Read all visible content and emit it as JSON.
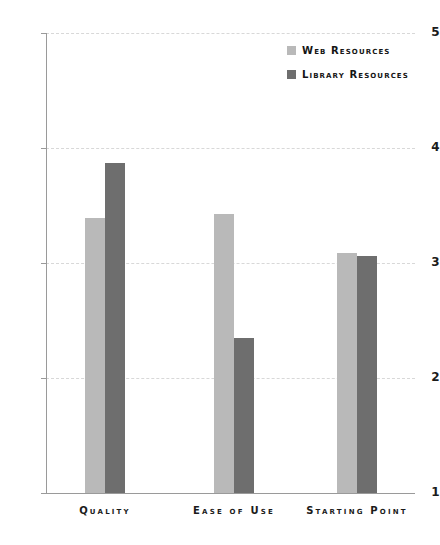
{
  "chart_data": {
    "type": "bar",
    "title": "",
    "xlabel": "",
    "ylabel": "",
    "categories": [
      "Quality",
      "Ease of Use",
      "Starting Point"
    ],
    "series": [
      {
        "name": "Web Resources",
        "color": "#b9b9b9",
        "values": [
          3.39,
          3.43,
          3.09
        ]
      },
      {
        "name": "Library Resources",
        "color": "#6e6e6e",
        "values": [
          3.87,
          2.35,
          3.06
        ]
      }
    ],
    "ylim": [
      1,
      5
    ],
    "yticks": [
      "5",
      "4",
      "3",
      "2",
      "1"
    ],
    "ytick_values": [
      5,
      4,
      3,
      2,
      1
    ],
    "grid": true,
    "grid_color": "#d8d8d8",
    "legend_position": "top-right",
    "axis_color": "#9a9a9a"
  },
  "legend": {
    "items": [
      {
        "label": "Web Resources",
        "swatch": "#b9b9b9"
      },
      {
        "label": "Library Resources",
        "swatch": "#6e6e6e"
      }
    ]
  },
  "title_clipped": ""
}
